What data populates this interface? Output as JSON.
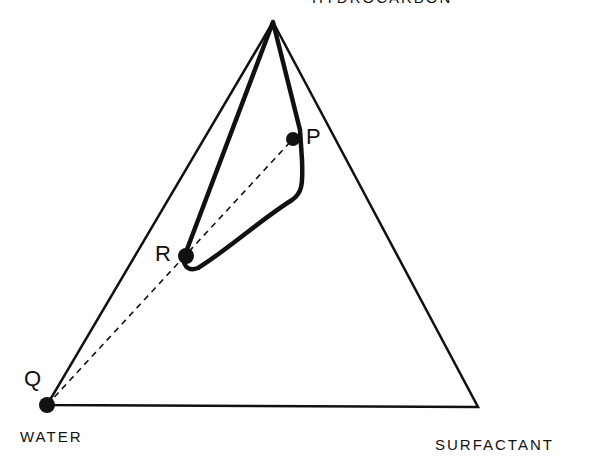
{
  "title_clipped": "HYDROCARBON",
  "vertices": {
    "top": {
      "label": "HYDROCARBON",
      "x": 273,
      "y": 22
    },
    "bottom_left": {
      "label": "WATER",
      "x": 47,
      "y": 405
    },
    "bottom_right": {
      "label": "SURFACTANT",
      "x": 478,
      "y": 407
    }
  },
  "points": {
    "P": {
      "label": "P",
      "x": 293,
      "y": 139
    },
    "Q": {
      "label": "Q",
      "x": 47,
      "y": 405
    },
    "R": {
      "label": "R",
      "x": 186,
      "y": 256
    }
  },
  "labels": {
    "water": "WATER",
    "surfactant": "SURFACTANT",
    "hydrocarbon": "HYDROCARBON",
    "p": "P",
    "q": "Q",
    "r": "R"
  },
  "colors": {
    "ink": "#111111",
    "background": "#ffffff"
  }
}
